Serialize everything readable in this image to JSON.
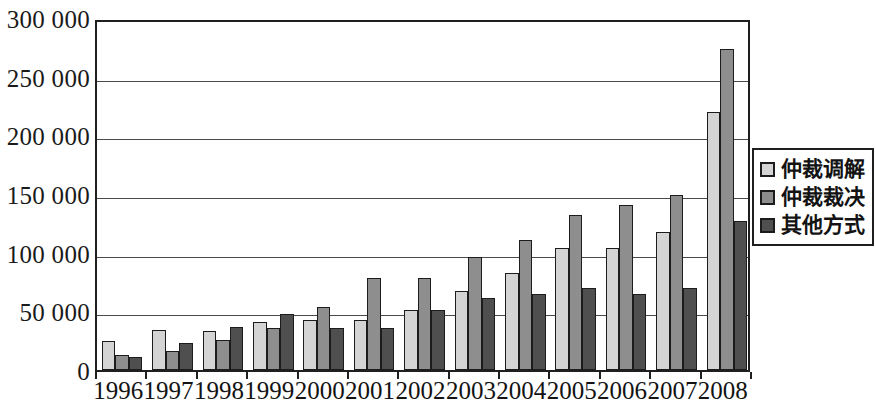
{
  "chart_data": {
    "type": "bar",
    "title": "",
    "subtitle": "",
    "xlabel": "",
    "ylabel": "",
    "ylim": [
      0,
      300000
    ],
    "ytick_step": 50000,
    "grid": true,
    "legend_position": "right",
    "categories": [
      "1996",
      "1997",
      "1998",
      "1999",
      "2000",
      "2001",
      "2002",
      "2003",
      "2004",
      "2005",
      "2006",
      "2007",
      "2008"
    ],
    "ytick_labels": [
      "300 000",
      "250 000",
      "200 000",
      "150 000",
      "100 000",
      "50 000",
      "0"
    ],
    "ytick_values": [
      300000,
      250000,
      200000,
      150000,
      100000,
      50000,
      0
    ],
    "series": [
      {
        "name": "仲裁调解",
        "color": "#d4d4d4",
        "values": [
          25000,
          34000,
          33000,
          41000,
          43000,
          43000,
          51000,
          67000,
          83000,
          104000,
          104000,
          118000,
          220000
        ]
      },
      {
        "name": "仲裁裁决",
        "color": "#8e8e8e",
        "values": [
          13000,
          16000,
          26000,
          36000,
          54000,
          78000,
          78000,
          96000,
          111000,
          132000,
          141000,
          149000,
          274000
        ]
      },
      {
        "name": "其他方式",
        "color": "#4f4f4f",
        "values": [
          11000,
          23000,
          37000,
          48000,
          36000,
          36000,
          51000,
          61000,
          65000,
          70000,
          65000,
          70000,
          127000
        ]
      }
    ]
  },
  "legend": {
    "items": [
      {
        "label": "仲裁调解",
        "swatch": "light-gray-swatch"
      },
      {
        "label": "仲裁裁决",
        "swatch": "medium-gray-swatch"
      },
      {
        "label": "其他方式",
        "swatch": "dark-gray-swatch"
      }
    ]
  },
  "colors": {
    "series_1": "#d4d4d4",
    "series_2": "#8e8e8e",
    "series_3": "#4f4f4f",
    "axis": "#1f1f1f",
    "gridline": "#4a4a4a",
    "background": "#ffffff"
  }
}
